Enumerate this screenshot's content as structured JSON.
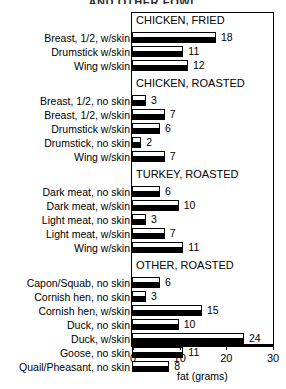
{
  "chart_data": {
    "type": "bar",
    "title": "AND OTHER FOWL",
    "xlabel": "fat (grams)",
    "ylabel": "",
    "xlim": [
      0,
      30
    ],
    "xticks": [
      0,
      10,
      20,
      30
    ],
    "orientation": "horizontal",
    "grid": false,
    "legend": null,
    "sections": [
      {
        "name": "CHICKEN, FRIED",
        "categories": [
          "Breast, 1/2, w/skin",
          "Drumstick w/skin",
          "Wing w/skin"
        ],
        "values": [
          18,
          11,
          12
        ]
      },
      {
        "name": "CHICKEN, ROASTED",
        "categories": [
          "Breast, 1/2, no skin",
          "Breast, 1/2, w/skin",
          "Drumstick w/skin",
          "Drumstick, no skin",
          "Wing w/skin"
        ],
        "values": [
          3,
          7,
          6,
          2,
          7
        ]
      },
      {
        "name": "TURKEY, ROASTED",
        "categories": [
          "Dark meat, no skin",
          "Dark meat, w/skin",
          "Light meat, no skin",
          "Light meat, w/skin",
          "Wing w/skin"
        ],
        "values": [
          6,
          10,
          3,
          7,
          11
        ]
      },
      {
        "name": "OTHER, ROASTED",
        "categories": [
          "Capon/Squab, no skin",
          "Cornish hen, no skin",
          "Cornish hen, w/skin",
          "Duck, no skin",
          "Duck, w/skin",
          "Goose, no skin",
          "Quail/Pheasant, no skin"
        ],
        "values": [
          6,
          3,
          15,
          10,
          24,
          11,
          8
        ]
      }
    ]
  }
}
